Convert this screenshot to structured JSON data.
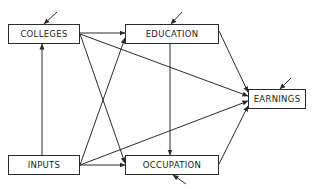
{
  "diagram": {
    "type": "path-diagram",
    "line_color": "#2a2a2a",
    "nodes": [
      {
        "id": "colleges",
        "label": "COLLEGES",
        "x": 8,
        "y": 24,
        "w": 72,
        "h": 20
      },
      {
        "id": "education",
        "label": "EDUCATION",
        "x": 125,
        "y": 24,
        "w": 94,
        "h": 20
      },
      {
        "id": "earnings",
        "label": "EARNINGS",
        "x": 248,
        "y": 89,
        "w": 58,
        "h": 20
      },
      {
        "id": "inputs",
        "label": "INPUTS",
        "x": 8,
        "y": 155,
        "w": 72,
        "h": 20
      },
      {
        "id": "occupation",
        "label": "OCCUPATION",
        "x": 125,
        "y": 155,
        "w": 94,
        "h": 20
      }
    ],
    "edges": [
      {
        "from": "colleges",
        "to": "education",
        "x1": 80,
        "y1": 33,
        "x2": 125,
        "y2": 33
      },
      {
        "from": "colleges",
        "to": "occupation",
        "x1": 80,
        "y1": 34,
        "x2": 125,
        "y2": 163
      },
      {
        "from": "colleges",
        "to": "earnings",
        "x1": 80,
        "y1": 34,
        "x2": 248,
        "y2": 96
      },
      {
        "from": "inputs",
        "to": "colleges",
        "x1": 42,
        "y1": 155,
        "x2": 42,
        "y2": 44
      },
      {
        "from": "inputs",
        "to": "education",
        "x1": 80,
        "y1": 165,
        "x2": 125,
        "y2": 38
      },
      {
        "from": "inputs",
        "to": "occupation",
        "x1": 80,
        "y1": 165,
        "x2": 125,
        "y2": 165
      },
      {
        "from": "inputs",
        "to": "earnings",
        "x1": 80,
        "y1": 165,
        "x2": 248,
        "y2": 101
      },
      {
        "from": "education",
        "to": "occupation",
        "x1": 170,
        "y1": 44,
        "x2": 170,
        "y2": 155
      },
      {
        "from": "education",
        "to": "earnings",
        "x1": 219,
        "y1": 31,
        "x2": 248,
        "y2": 92
      },
      {
        "from": "occupation",
        "to": "earnings",
        "x1": 219,
        "y1": 164,
        "x2": 248,
        "y2": 106
      }
    ],
    "disturbances": [
      {
        "to": "colleges",
        "x1": 57,
        "y1": 12,
        "x2": 44,
        "y2": 24
      },
      {
        "to": "education",
        "x1": 182,
        "y1": 12,
        "x2": 171,
        "y2": 24
      },
      {
        "to": "earnings",
        "x1": 291,
        "y1": 78,
        "x2": 280,
        "y2": 89
      },
      {
        "to": "occupation",
        "x1": 186,
        "y1": 184,
        "x2": 173,
        "y2": 175
      }
    ]
  }
}
